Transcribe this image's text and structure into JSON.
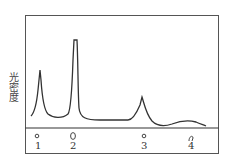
{
  "diagram": {
    "y_axis_label": "光密度",
    "bands": [
      {
        "label": "1",
        "x": 37,
        "shape": "small-circle"
      },
      {
        "label": "2",
        "x": 73,
        "shape": "oval"
      },
      {
        "label": "3",
        "x": 144,
        "shape": "small-circle"
      },
      {
        "label": "4",
        "x": 191,
        "shape": "arc"
      }
    ],
    "peaks": [
      {
        "band": "1",
        "relative_height": "medium"
      },
      {
        "band": "2",
        "relative_height": "highest"
      },
      {
        "band": "3",
        "relative_height": "low"
      },
      {
        "band": "4",
        "relative_height": "very-low-broad"
      }
    ],
    "colors": {
      "line": "#333333",
      "background": "#ffffff"
    }
  }
}
